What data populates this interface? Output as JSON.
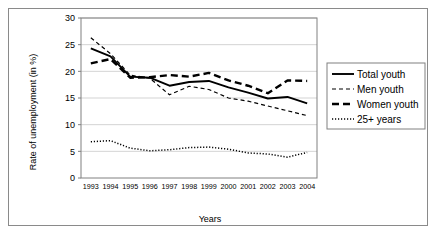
{
  "chart_data": {
    "type": "line",
    "title": "",
    "xlabel": "Years",
    "ylabel": "Rate of unemployment (in %)",
    "categories": [
      "1993",
      "1994",
      "1995",
      "1996",
      "1997",
      "1998",
      "1999",
      "2000",
      "2001",
      "2002",
      "2003",
      "2004"
    ],
    "ylim": [
      0,
      30
    ],
    "yticks": [
      0,
      5,
      10,
      15,
      20,
      25,
      30
    ],
    "grid": true,
    "legend_position": "right",
    "series": [
      {
        "name": "Total youth",
        "style": "solid",
        "values": [
          24.3,
          22.8,
          19.0,
          18.8,
          17.3,
          18.0,
          18.2,
          17.0,
          16.0,
          14.9,
          15.2,
          14.0
        ]
      },
      {
        "name": "Men youth",
        "style": "dashed-small",
        "values": [
          26.3,
          23.3,
          19.3,
          18.7,
          15.6,
          17.2,
          16.6,
          15.0,
          14.4,
          13.5,
          12.6,
          11.7
        ]
      },
      {
        "name": "Women youth",
        "style": "dashed-thick",
        "values": [
          21.5,
          22.3,
          18.8,
          18.9,
          19.3,
          19.0,
          19.7,
          18.3,
          17.3,
          15.9,
          18.3,
          18.2
        ]
      },
      {
        "name": "25+ years",
        "style": "dotted",
        "values": [
          6.8,
          7.0,
          5.6,
          5.1,
          5.3,
          5.7,
          5.8,
          5.4,
          4.7,
          4.5,
          3.9,
          4.8
        ]
      }
    ]
  },
  "legend": {
    "items": [
      {
        "label": "Total youth"
      },
      {
        "label": "Men youth"
      },
      {
        "label": "Women youth"
      },
      {
        "label": "25+ years"
      }
    ]
  },
  "colors": {
    "line": "#000000",
    "grid": "#c8c8c8",
    "axis": "#808080",
    "frame": "#8a8a8a",
    "background": "#ffffff"
  }
}
